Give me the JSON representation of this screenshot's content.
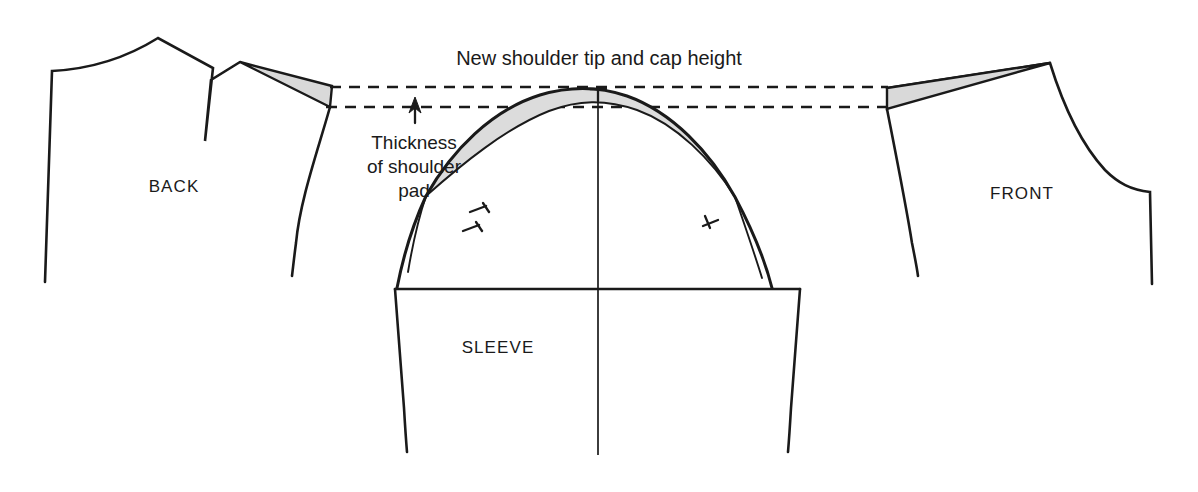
{
  "figure": {
    "kind": "sewing-pattern-diagram",
    "title_note": "New shoulder tip and cap height",
    "background_color": "#ffffff",
    "ink_color": "#1a1a1a",
    "shade_color": "#d9d9d9"
  },
  "labels": {
    "title": "New shoulder tip and cap height",
    "callout_line1": "Thickness",
    "callout_line2": "of shoulder",
    "callout_line3": "pad",
    "back_piece": "BACK",
    "front_piece": "FRONT",
    "sleeve_piece": "SLEEVE"
  },
  "reference_lines": {
    "upper": {
      "name": "new-shoulder-tip-line",
      "y": 87,
      "x_start": 330,
      "x_end": 888
    },
    "lower": {
      "name": "shoulder-pad-thickness-line",
      "y": 107,
      "x_start": 326,
      "x_end": 888
    }
  },
  "arrow": {
    "name": "thickness-arrow",
    "x": 415,
    "y_tip": 99,
    "y_base": 122,
    "direction": "up"
  },
  "notches": [
    {
      "name": "sleeve-cap-center-notch",
      "position": "cap-apex",
      "count": 1
    },
    {
      "name": "sleeve-cap-back-notch",
      "position": "left-back-seam",
      "count": 2
    },
    {
      "name": "sleeve-cap-front-notch",
      "position": "right-front-seam",
      "count": 1
    }
  ],
  "shaded_regions": [
    {
      "name": "back-shoulder-pad-wedge",
      "piece": "BACK",
      "color": "#d9d9d9"
    },
    {
      "name": "front-shoulder-pad-wedge",
      "piece": "FRONT",
      "color": "#d9d9d9"
    },
    {
      "name": "sleeve-cap-added-height",
      "piece": "SLEEVE",
      "color": "#dcdcdc"
    }
  ]
}
